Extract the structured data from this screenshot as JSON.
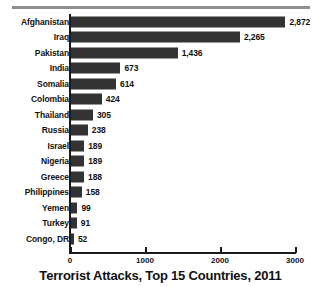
{
  "chart_data": {
    "type": "bar",
    "orientation": "horizontal",
    "title": "Terrorist Attacks, Top 15 Countries, 2011",
    "xlabel": "",
    "ylabel": "",
    "xlim": [
      0,
      3000
    ],
    "xticks": [
      0,
      1000,
      2000,
      3000
    ],
    "xtick_labels": [
      "0",
      "1000",
      "2000",
      "3000"
    ],
    "grid": false,
    "legend": false,
    "bar_color": "#333333",
    "categories": [
      "Afghanistan",
      "Iraq",
      "Pakistan",
      "India",
      "Somalia",
      "Colombia",
      "Thailand",
      "Russia",
      "Israel",
      "Nigeria",
      "Greece",
      "Philippines",
      "Yemen",
      "Turkey",
      "Congo, DR"
    ],
    "values": [
      2872,
      2265,
      1436,
      673,
      614,
      424,
      305,
      238,
      189,
      189,
      188,
      158,
      99,
      91,
      52
    ],
    "value_labels": [
      "2,872",
      "2,265",
      "1,436",
      "673",
      "614",
      "424",
      "305",
      "238",
      "189",
      "189",
      "188",
      "158",
      "99",
      "91",
      "52"
    ]
  }
}
